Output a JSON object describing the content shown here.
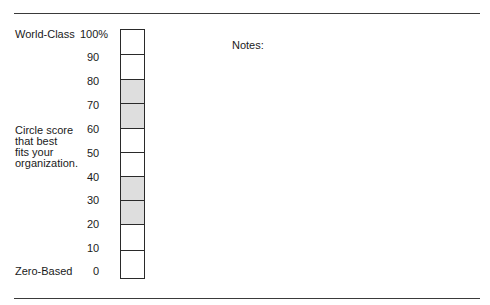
{
  "rules": {
    "top_y": 13,
    "bottom_y": 299
  },
  "labels": {
    "top": "World-Class",
    "bottom": "Zero-Based",
    "instruction_lines": [
      "Circle score",
      "that best",
      "fits your",
      "organization."
    ]
  },
  "scale": {
    "ticks": [
      "100%",
      "90",
      "80",
      "70",
      "60",
      "50",
      "40",
      "30",
      "20",
      "10",
      "0"
    ],
    "cells": [
      {
        "range": "90-100",
        "shaded": false
      },
      {
        "range": "80-90",
        "shaded": false
      },
      {
        "range": "70-80",
        "shaded": true
      },
      {
        "range": "60-70",
        "shaded": true
      },
      {
        "range": "50-60",
        "shaded": false
      },
      {
        "range": "40-50",
        "shaded": false
      },
      {
        "range": "30-40",
        "shaded": true
      },
      {
        "range": "20-30",
        "shaded": true
      },
      {
        "range": "10-20",
        "shaded": false
      },
      {
        "range": "0-10",
        "shaded": false
      }
    ],
    "shade_color": "#dedede",
    "line_color": "#2a2a2a"
  },
  "notes": {
    "label": "Notes:"
  }
}
